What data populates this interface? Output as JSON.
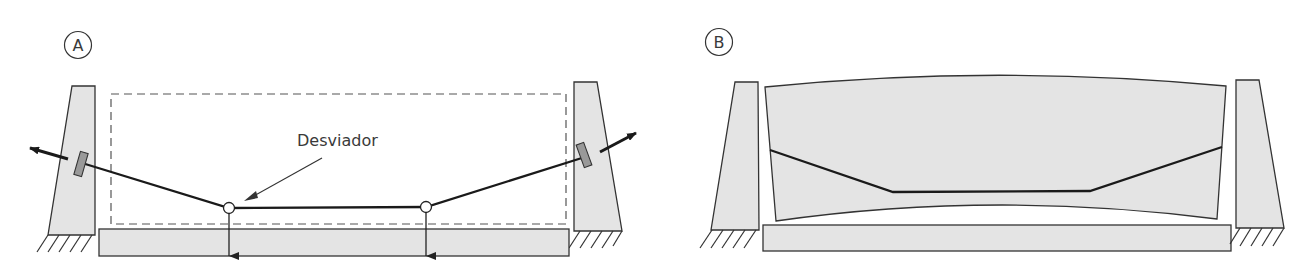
{
  "figure": {
    "panels": [
      {
        "id": "A",
        "label": "A",
        "description": "Externally prestressed segment with deviators and anchorages in abutments"
      },
      {
        "id": "B",
        "label": "B",
        "description": "Deformed (cambered) deck block with tendon profile between abutments"
      }
    ],
    "annotations": {
      "deviator_label": "Desviador"
    },
    "colors": {
      "stroke": "#333333",
      "fill": "#e4e4e4",
      "anchor_plate": "#999999",
      "tendon": "#1a1a1a",
      "dash": "#555555"
    }
  }
}
